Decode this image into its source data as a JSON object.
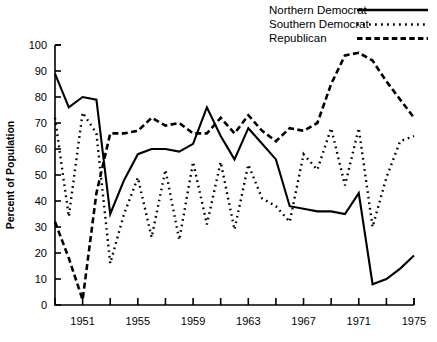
{
  "chart_data": {
    "type": "line",
    "title": "",
    "xlabel": "",
    "ylabel": "Percent of Population",
    "xlim": [
      1949,
      1975
    ],
    "ylim": [
      0,
      100
    ],
    "grid": false,
    "legend_position": "top-right",
    "x": [
      1949,
      1950,
      1951,
      1952,
      1953,
      1954,
      1955,
      1956,
      1957,
      1958,
      1959,
      1960,
      1961,
      1962,
      1963,
      1964,
      1965,
      1966,
      1967,
      1968,
      1969,
      1970,
      1971,
      1972,
      1973,
      1974,
      1975
    ],
    "xtick_values": [
      1949,
      1951,
      1953,
      1955,
      1957,
      1959,
      1961,
      1963,
      1965,
      1967,
      1969,
      1971,
      1973,
      1975
    ],
    "xtick_labels": [
      "",
      "1951",
      "",
      "1955",
      "",
      "1959",
      "",
      "1963",
      "",
      "1967",
      "",
      "1971",
      "",
      "1975"
    ],
    "ytick_values": [
      0,
      10,
      20,
      30,
      40,
      50,
      60,
      70,
      80,
      90,
      100
    ],
    "ytick_labels": [
      "0",
      "10",
      "20",
      "30",
      "40",
      "50",
      "60",
      "70",
      "80",
      "90",
      "100"
    ],
    "series": [
      {
        "name": "Northern Democrat",
        "style": "solid",
        "values": [
          89,
          76,
          80,
          79,
          35,
          48,
          58,
          60,
          60,
          59,
          62,
          76,
          65,
          56,
          68,
          62,
          56,
          38,
          37,
          36,
          36,
          35,
          43,
          8,
          10,
          14,
          19
        ]
      },
      {
        "name": "Southern Democrat",
        "style": "dotted",
        "values": [
          72,
          34,
          74,
          66,
          16,
          35,
          49,
          26,
          52,
          25,
          55,
          31,
          55,
          29,
          54,
          41,
          38,
          32,
          58,
          52,
          68,
          46,
          68,
          30,
          49,
          63,
          65
        ]
      },
      {
        "name": "Republican",
        "style": "dashed",
        "values": [
          32,
          18,
          2,
          43,
          66,
          66,
          67,
          72,
          69,
          70,
          66,
          66,
          72,
          66,
          73,
          67,
          63,
          68,
          67,
          70,
          85,
          96,
          97,
          94,
          86,
          79,
          72
        ]
      }
    ]
  },
  "legend": {
    "items": [
      {
        "label": "Northern Democrat",
        "style": "solid"
      },
      {
        "label": "Southern Democrat",
        "style": "dotted"
      },
      {
        "label": "Republican",
        "style": "dashed"
      }
    ]
  },
  "axes": {
    "y_axis_title": "Percent of Population"
  }
}
